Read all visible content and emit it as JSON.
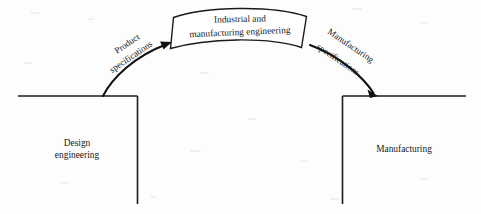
{
  "diagram": {
    "type": "process-bridge-diagram",
    "background_color": "#fdfdfd",
    "line_color": "#1b1b1b",
    "text_color": "#1a1a1a"
  },
  "bridge_banner": {
    "name": "industrial-and-manufacturing-engineering-banner",
    "line1": "Industrial and",
    "line2": "manufacturing engineering",
    "shape": "arched-banner",
    "fill": "#ffffff"
  },
  "regions": [
    {
      "id": "design-engineering",
      "line1": "Design",
      "line2": "engineering",
      "side": "left"
    },
    {
      "id": "manufacturing",
      "line1": "Manufacturing",
      "line2": "",
      "side": "right"
    }
  ],
  "arrows": [
    {
      "id": "product-specifications-arrow",
      "line1": "Product",
      "line2": "specifications",
      "from": "design-engineering",
      "to": "industrial-and-manufacturing-engineering-banner",
      "direction": "up-right"
    },
    {
      "id": "manufacturing-specifications-arrow",
      "line1": "Manufacturing",
      "line2": "specifications",
      "from": "industrial-and-manufacturing-engineering-banner",
      "to": "manufacturing",
      "direction": "down-right"
    }
  ]
}
